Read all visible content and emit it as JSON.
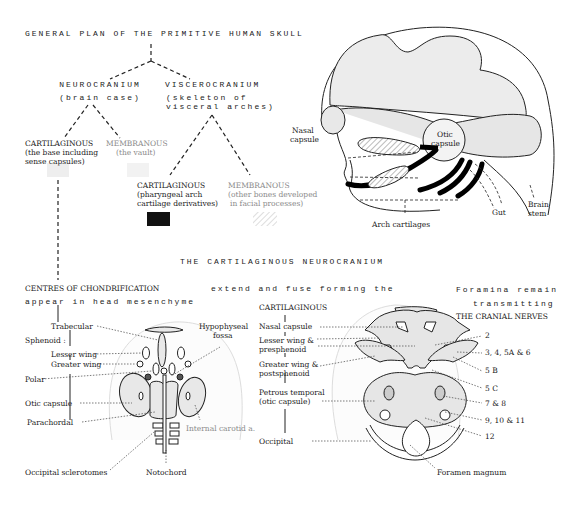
{
  "title": "GENERAL PLAN OF THE PRIMITIVE HUMAN SKULL",
  "tree": {
    "neurocranium": {
      "label": "NEUROCRANIUM",
      "sub": "(brain case)"
    },
    "viscerocranium": {
      "label": "VISCEROCRANIUM",
      "sub1": "(skeleton   of",
      "sub2": "visceral arches)"
    },
    "neuro_cartilaginous": {
      "label": "CARTILAGINOUS",
      "sub1": "(the base including",
      "sub2": "sense capsules)"
    },
    "neuro_membranous": {
      "label": "MEMBRANOUS",
      "sub": "(the vault)"
    },
    "visc_cartilaginous": {
      "label": "CARTILAGINOUS",
      "sub1": "(pharyngeal arch",
      "sub2": "cartilage derivatives)",
      "legend_swatch": "solid-black"
    },
    "visc_membranous": {
      "label": "MEMBRANOUS",
      "sub1": "(other bones developed",
      "sub2": "in facial processes)",
      "legend_swatch": "hatched"
    }
  },
  "lateral_view": {
    "labels": {
      "nasal1": "Nasal",
      "nasal2": "capsule",
      "otic1": "Otic",
      "otic2": "capsule",
      "arch": "Arch cartilages",
      "gut": "Gut",
      "brain1": "Brain",
      "brain2": "stem"
    }
  },
  "section_title": "THE   CARTILAGINOUS   NEUROCRANIUM",
  "left_panel": {
    "heading1": "CENTRES OF CHONDRIFICATION",
    "heading2": "appear in head mesenchyme",
    "labels": {
      "trabecular": "Trabecular",
      "sphenoid": "Sphenoid :",
      "lesser_wing": "Lesser wing",
      "greater_wing": "Greater wing",
      "polar": "Polar",
      "otic_capsule": "Otic capsule",
      "parachordal": "Parachordal",
      "occipital_sclerotomes": "Occipital sclerotomes",
      "notochord": "Notochord",
      "hypophyseal1": "Hypophyseal",
      "hypophyseal2": "fossa",
      "internal_carotid": "Internal  carotid a."
    }
  },
  "middle_text": "extend and fuse forming the",
  "right_panel": {
    "heading": "CARTILAGINOUS",
    "labels": {
      "nasal_capsule": "Nasal capsule",
      "lesser_wing1": "Lesser wing &",
      "lesser_wing2": "presphenoid",
      "greater_wing1": "Greater wing &",
      "greater_wing2": "postsphenoid",
      "petrous1": "Petrous temporal",
      "petrous2": "(otic capsule)",
      "occipital": "Occipital",
      "foramen_magnum": "Foramen magnum"
    },
    "nerves_heading1": "Foramina   remain",
    "nerves_heading2": "transmitting",
    "nerves_heading3": "THE CRANIAL NERVES",
    "nerves": [
      "2",
      "3, 4, 5A & 6",
      "5 B",
      "5 C",
      "7 & 8",
      "9, 10 & 11",
      "12"
    ]
  }
}
